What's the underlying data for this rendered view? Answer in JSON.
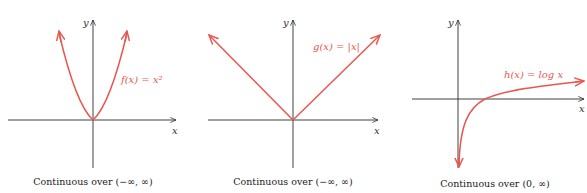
{
  "colors": {
    "curve": "#e8574f",
    "axis": "#2b2b2b",
    "caption": "#222222"
  },
  "panels": [
    {
      "function_label": "f(x) = x²",
      "x_axis_label": "x",
      "y_axis_label": "y",
      "caption": "Continuous over (−∞, ∞)"
    },
    {
      "function_label": "g(x) = |x|",
      "x_axis_label": "x",
      "y_axis_label": "y",
      "caption": "Continuous over (−∞, ∞)"
    },
    {
      "function_label": "h(x) = log x",
      "x_axis_label": "x",
      "y_axis_label": "y",
      "caption": "Continuous over (0, ∞)"
    }
  ]
}
